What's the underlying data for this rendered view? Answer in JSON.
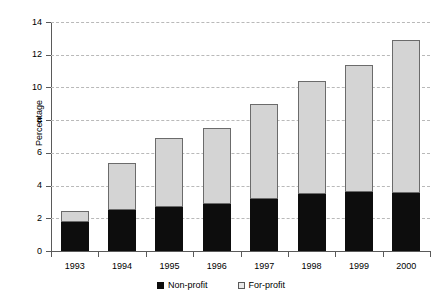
{
  "chart_data": {
    "type": "bar",
    "stacked": true,
    "title": "",
    "xlabel": "",
    "ylabel": "Percentage",
    "categories": [
      "1993",
      "1994",
      "1995",
      "1996",
      "1997",
      "1998",
      "1999",
      "2000"
    ],
    "series": [
      {
        "name": "Non-profit",
        "color": "#0d0d0d",
        "values": [
          1.8,
          2.5,
          2.7,
          2.85,
          3.2,
          3.5,
          3.6,
          3.55
        ]
      },
      {
        "name": "For-profit",
        "color": "#d4d4d4",
        "values": [
          0.65,
          2.9,
          4.2,
          4.65,
          5.8,
          6.9,
          7.8,
          9.35
        ]
      }
    ],
    "totals": [
      2.45,
      5.4,
      6.9,
      7.5,
      9.0,
      10.4,
      11.4,
      12.9
    ],
    "ylim": [
      0,
      14
    ],
    "yticks": [
      "0",
      "2",
      "4",
      "6",
      "8",
      "10",
      "12",
      "14"
    ],
    "ytick_values": [
      0,
      2,
      4,
      6,
      8,
      10,
      12,
      14
    ],
    "grid": true,
    "grid_style": "dashed-horizontal",
    "legend_position": "bottom-center"
  },
  "legend": {
    "items": [
      {
        "label": "Non-profit",
        "swatch": "dark-square"
      },
      {
        "label": "For-profit",
        "swatch": "light-square"
      }
    ]
  },
  "colors": {
    "non_profit": "#0d0d0d",
    "for_profit": "#d4d4d4",
    "axis": "#5a5a5a",
    "grid": "#b9b9b9",
    "background": "#ffffff"
  }
}
